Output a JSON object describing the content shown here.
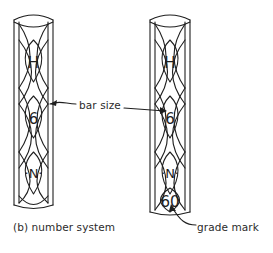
{
  "figure": {
    "caption": "(b) number system",
    "bars": [
      {
        "id": "left-bar",
        "name": "rebar-left",
        "marks": [
          {
            "slot": 1,
            "text": "H"
          },
          {
            "slot": 2,
            "text": "6"
          },
          {
            "slot": 3,
            "text": "·N·"
          },
          {
            "slot": 4,
            "text": ""
          }
        ]
      },
      {
        "id": "right-bar",
        "name": "rebar-right",
        "marks": [
          {
            "slot": 1,
            "text": "H"
          },
          {
            "slot": 2,
            "text": "6"
          },
          {
            "slot": 3,
            "text": "·N·"
          },
          {
            "slot": 4,
            "text": "60"
          }
        ]
      }
    ],
    "annotations": [
      {
        "id": "bar-size",
        "label": "bar size",
        "points_to": "6"
      },
      {
        "id": "grade-mark",
        "label": "grade mark",
        "points_to": "60"
      }
    ],
    "colors": {
      "line": "#1f1f1f",
      "text": "#2b2b2b",
      "background": "#ffffff"
    }
  }
}
